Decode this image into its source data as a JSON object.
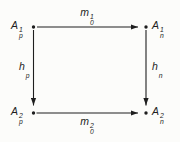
{
  "figure": {
    "background": "#fcfcfa",
    "ink": "#1e1e1e"
  },
  "diagram": {
    "nodes": {
      "top_left": {
        "base": "A",
        "sup": "1",
        "sub": "p"
      },
      "top_right": {
        "base": "A",
        "sup": "1",
        "sub": "n"
      },
      "bottom_left": {
        "base": "A",
        "sup": "2",
        "sub": "p"
      },
      "bottom_right": {
        "base": "A",
        "sup": "2",
        "sub": "n"
      }
    },
    "edges": {
      "top": {
        "base": "m",
        "sup": "1",
        "sub": "0"
      },
      "bottom": {
        "base": "m",
        "sup": "2",
        "sub": "0"
      },
      "left": {
        "base": "h",
        "sup": "",
        "sub": "p"
      },
      "right": {
        "base": "h",
        "sup": "",
        "sub": "n"
      }
    }
  }
}
